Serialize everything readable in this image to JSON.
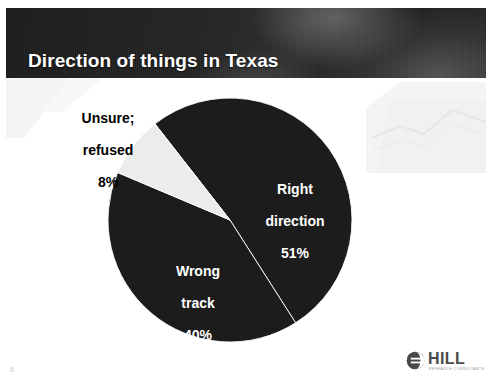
{
  "slide": {
    "title": "Direction of things in Texas",
    "page_number": "6",
    "header_bg_color": "#232323",
    "background_color": "#ffffff"
  },
  "logo": {
    "name": "HILL",
    "tagline": "RESEARCH CONSULTANTS",
    "mark_icon": "globe-icon",
    "color": "#4a4a4a"
  },
  "chart_data": {
    "type": "pie",
    "title": "Direction of things in Texas",
    "xlabel": "",
    "ylabel": "",
    "legend_position": "none",
    "grid": false,
    "labels_inside": true,
    "center": {
      "x": 230,
      "y": 220
    },
    "radius": 122,
    "start_angle_deg": -128,
    "categories": [
      "Right direction",
      "Wrong track",
      "Unsure; refused"
    ],
    "values": [
      51,
      40,
      8
    ],
    "value_suffix": "%",
    "colors": [
      "#1c1c1c",
      "#1c1c1c",
      "#ececec"
    ],
    "slices": [
      {
        "name": "Right direction",
        "label_line1": "Right",
        "label_line2": "direction",
        "value": 51,
        "value_text": "51%",
        "color": "#1c1c1c",
        "label_color": "#ffffff"
      },
      {
        "name": "Wrong track",
        "label_line1": "Wrong",
        "label_line2": "track",
        "value": 40,
        "value_text": "40%",
        "color": "#1c1c1c",
        "label_color": "#ffffff"
      },
      {
        "name": "Unsure; refused",
        "label_line1": "Unsure;",
        "label_line2": "refused",
        "value": 8,
        "value_text": "8%",
        "color": "#ececec",
        "label_color": "#000000"
      }
    ]
  }
}
